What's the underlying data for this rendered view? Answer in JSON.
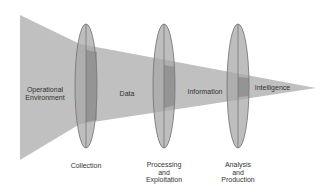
{
  "diagram": {
    "type": "intelligence-process-funnel",
    "colors": {
      "background": "#ffffff",
      "funnel": "#bdbdbd",
      "lens_fill": "#a8a8a8",
      "lens_stroke": "#6e6e6e",
      "overlap": "#8f8f8f",
      "text": "#333333"
    },
    "stages": [
      {
        "id": "operational-environment",
        "label": "Operational\nEnvironment"
      },
      {
        "id": "data",
        "label": "Data"
      },
      {
        "id": "information",
        "label": "Information"
      },
      {
        "id": "intelligence",
        "label": "Intelligence"
      }
    ],
    "lenses": [
      {
        "id": "collection",
        "label": "Collection"
      },
      {
        "id": "processing-exploitation",
        "label": "Processing\nand\nExploitation"
      },
      {
        "id": "analysis-production",
        "label": "Analysis\nand\nProduction"
      }
    ]
  }
}
